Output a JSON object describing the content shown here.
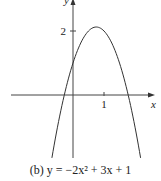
{
  "chart_data": {
    "type": "line",
    "title": "(b) y = −2x² + 3x + 1",
    "caption": {
      "prefix": "(b) ",
      "equation": "y = −2x² + 3x + 1"
    },
    "function": "y = -2x^2 + 3x + 1",
    "xlabel": "x",
    "ylabel": "y",
    "x_ticks": [
      {
        "value": 1,
        "label": "1"
      }
    ],
    "y_ticks": [
      {
        "value": 2,
        "label": "2"
      }
    ],
    "xlim": [
      -2.0,
      2.6
    ],
    "ylim": [
      -1.97,
      2.9
    ],
    "grid": false,
    "legend": null,
    "vertex": {
      "x": 0.75,
      "y": 2.125
    },
    "x_intercepts": [
      -0.28,
      1.78
    ],
    "y_intercept": 1,
    "series": [
      {
        "name": "y = -2x^2 + 3x + 1",
        "x": [
          -0.68,
          -0.5,
          -0.25,
          0,
          0.25,
          0.5,
          0.75,
          1,
          1.25,
          1.5,
          1.75,
          2,
          2.18
        ],
        "y": [
          -1.96,
          -1.0,
          0.125,
          1,
          1.625,
          2,
          2.125,
          2,
          1.625,
          1,
          0.125,
          -1.0,
          -1.96
        ]
      }
    ],
    "color": "#333333"
  },
  "mapping": {
    "origin_px": [
      73,
      95
    ],
    "px_per_unit_x": 31,
    "px_per_unit_y": 32
  }
}
